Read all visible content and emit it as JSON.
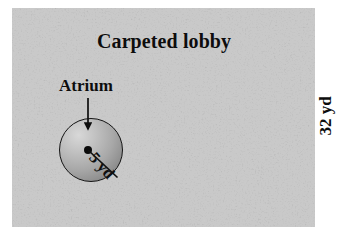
{
  "figure": {
    "title": "Carpeted lobby",
    "region_name": "Carpeted lobby",
    "atrium_label": "Atrium",
    "radius_label": "5 yd",
    "height_label": "32 yd"
  },
  "diagram_data": {
    "type": "geometry-diagram",
    "shapes": [
      {
        "name": "carpeted-lobby",
        "kind": "rectangle",
        "label": "Carpeted lobby",
        "fill": "#9b9b9b",
        "texture": "mottled-carpet-noise",
        "dimensions": [
          {
            "name": "height",
            "value": 32,
            "unit": "yd",
            "label": "32 yd"
          }
        ]
      },
      {
        "name": "atrium",
        "kind": "circle",
        "label": "Atrium",
        "fill": "radial-gradient-gray",
        "dimensions": [
          {
            "name": "radius",
            "value": 5,
            "unit": "yd",
            "label": "5 yd"
          }
        ]
      }
    ],
    "annotations": [
      {
        "name": "atrium-pointer",
        "kind": "arrow",
        "from": "Atrium",
        "to": "atrium circle"
      },
      {
        "name": "radius-line",
        "kind": "segment",
        "from": "center",
        "to": "circle edge",
        "label": "5 yd"
      }
    ]
  },
  "colors": {
    "carpet_base": "#9b9b9b",
    "carpet_light": "#c5c5c5",
    "carpet_dark": "#777777",
    "ink": "#0d0d0d",
    "circle_highlight": "#d8d8d8",
    "circle_shadow": "#787878",
    "page_background": "#ffffff"
  }
}
